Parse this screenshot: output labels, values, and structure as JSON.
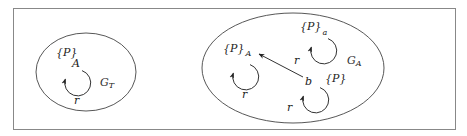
{
  "frame": {
    "x": 13,
    "y": 8,
    "width": 442,
    "height": 121,
    "stroke": "#888888"
  },
  "colors": {
    "stroke": "#333333",
    "text": "#222222"
  },
  "graphs": [
    {
      "id": "left",
      "name": "G_T",
      "label_main": "G",
      "label_sub": "T",
      "ellipse": {
        "cx": 86,
        "cy": 72,
        "rx": 50,
        "ry": 39
      },
      "label_pos": {
        "x": 100,
        "y": 86
      },
      "nodes": [
        {
          "id": "A",
          "label": "A",
          "label_pos": {
            "x": 72,
            "y": 67
          },
          "props": "{P}",
          "props_sub": "",
          "props_pos": {
            "x": 56,
            "y": 56
          },
          "loop": {
            "cx": 78,
            "cy": 83,
            "r": 13,
            "label": "r",
            "label_pos": {
              "x": 74,
              "y": 104
            }
          }
        }
      ]
    },
    {
      "id": "right",
      "name": "G_A",
      "label_main": "G",
      "label_sub": "A",
      "ellipse": {
        "cx": 293,
        "cy": 68,
        "rx": 91,
        "ry": 55
      },
      "label_pos": {
        "x": 347,
        "y": 64
      },
      "nodes": [
        {
          "id": "A",
          "label": "",
          "props": "{P}",
          "props_sub": "A",
          "props_pos": {
            "x": 223,
            "y": 52
          },
          "loop": {
            "cx": 246,
            "cy": 77,
            "r": 13,
            "label": "r",
            "label_pos": {
              "x": 242,
              "y": 98
            }
          }
        },
        {
          "id": "a",
          "label": "",
          "props": "{P}",
          "props_sub": "a",
          "props_pos": {
            "x": 300,
            "y": 30
          },
          "loop": {
            "cx": 324,
            "cy": 51,
            "r": 13,
            "label": "r",
            "label_pos": {
              "x": 294,
              "y": 64
            }
          }
        },
        {
          "id": "b",
          "label": "b",
          "label_pos": {
            "x": 305,
            "y": 85
          },
          "props": "{P}",
          "props_sub": "",
          "props_pos": {
            "x": 325,
            "y": 82
          },
          "loop": {
            "cx": 316,
            "cy": 100,
            "r": 13,
            "label": "r",
            "label_pos": {
              "x": 287,
              "y": 111
            }
          }
        }
      ],
      "edges": [
        {
          "from": "b",
          "to": "A",
          "x1": 303,
          "y1": 77,
          "x2": 259,
          "y2": 54
        }
      ]
    }
  ],
  "text": {
    "left_props": "{P}",
    "left_node": "A",
    "left_loop": "r",
    "left_graph": "G",
    "left_graph_sub": "T",
    "right_A_props": "{P}",
    "right_A_sub": "A",
    "right_A_loop": "r",
    "right_a_props": "{P}",
    "right_a_sub": "a",
    "right_a_loop": "r",
    "right_b_node": "b",
    "right_b_props": "{P}",
    "right_b_loop": "r",
    "right_graph": "G",
    "right_graph_sub": "A"
  }
}
